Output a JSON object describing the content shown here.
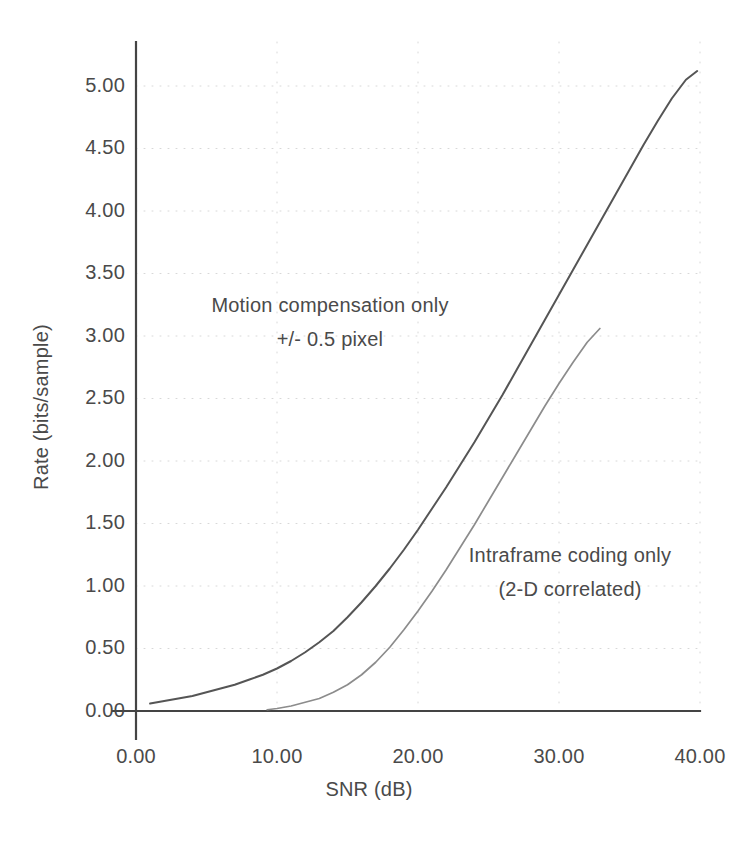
{
  "chart_data": {
    "type": "line",
    "title": "",
    "xlabel": "SNR (dB)",
    "ylabel": "Rate (bits/sample)",
    "xlim": [
      0,
      40
    ],
    "ylim": [
      0,
      5.0
    ],
    "xticks": [
      "0.00",
      "10.00",
      "20.00",
      "30.00",
      "40.00"
    ],
    "xtick_values": [
      0,
      10,
      20,
      30,
      40
    ],
    "yticks": [
      "0.00",
      "0.50",
      "1.00",
      "1.50",
      "2.00",
      "2.50",
      "3.00",
      "3.50",
      "4.00",
      "4.50",
      "5.00"
    ],
    "ytick_values": [
      0,
      0.5,
      1.0,
      1.5,
      2.0,
      2.5,
      3.0,
      3.5,
      4.0,
      4.5,
      5.0
    ],
    "grid": true,
    "grid_style": "dotted",
    "legend_position": "inline-annotations",
    "line_color": "#555555",
    "axis_color": "#444444",
    "series": [
      {
        "name": "Motion compensation only +/- 0.5 pixel",
        "color": "#555555",
        "x": [
          1.0,
          2.0,
          3.0,
          4.0,
          5.0,
          6.0,
          7.0,
          8.0,
          9.0,
          10.0,
          11.0,
          12.0,
          13.0,
          14.0,
          15.0,
          16.0,
          17.0,
          18.0,
          19.0,
          20.0,
          21.0,
          22.0,
          23.0,
          24.0,
          25.0,
          26.0,
          27.0,
          28.0,
          29.0,
          30.0,
          31.0,
          32.0,
          33.0,
          34.0,
          35.0,
          36.0,
          37.0,
          38.0,
          39.0,
          39.8
        ],
        "y": [
          0.06,
          0.08,
          0.1,
          0.12,
          0.15,
          0.18,
          0.21,
          0.25,
          0.29,
          0.34,
          0.4,
          0.47,
          0.55,
          0.64,
          0.75,
          0.87,
          1.0,
          1.14,
          1.29,
          1.45,
          1.62,
          1.79,
          1.97,
          2.15,
          2.34,
          2.53,
          2.73,
          2.93,
          3.13,
          3.33,
          3.53,
          3.73,
          3.93,
          4.13,
          4.33,
          4.53,
          4.72,
          4.9,
          5.05,
          5.12
        ]
      },
      {
        "name": "Intraframe coding only (2-D correlated)",
        "color": "#8c8c8c",
        "x": [
          9.3,
          10.0,
          11.0,
          12.0,
          13.0,
          14.0,
          15.0,
          16.0,
          17.0,
          18.0,
          19.0,
          20.0,
          21.0,
          22.0,
          23.0,
          24.0,
          25.0,
          26.0,
          27.0,
          28.0,
          29.0,
          30.0,
          31.0,
          32.0,
          32.9
        ],
        "y": [
          0.01,
          0.02,
          0.04,
          0.07,
          0.1,
          0.15,
          0.21,
          0.29,
          0.39,
          0.51,
          0.65,
          0.8,
          0.96,
          1.13,
          1.31,
          1.49,
          1.68,
          1.87,
          2.06,
          2.25,
          2.44,
          2.62,
          2.79,
          2.95,
          3.06
        ]
      }
    ],
    "annotations": [
      {
        "name": "motion-compensation-annotation",
        "lines": [
          "Motion compensation only",
          "+/- 0.5 pixel"
        ],
        "x_px": 330,
        "y_px": 295
      },
      {
        "name": "intraframe-coding-annotation",
        "lines": [
          "Intraframe coding only",
          "(2-D correlated)"
        ],
        "x_px": 570,
        "y_px": 545
      }
    ]
  },
  "axes": {
    "x_title": "SNR (dB)",
    "y_title": "Rate (bits/sample)"
  }
}
